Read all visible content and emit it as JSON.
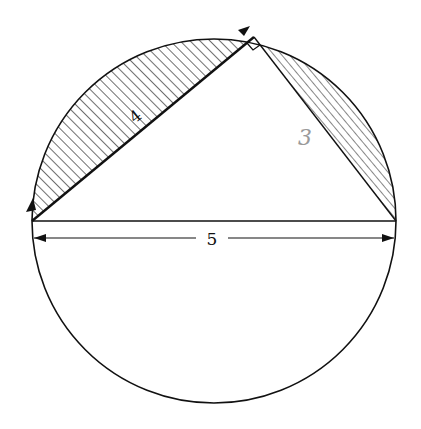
{
  "diagram": {
    "colors": {
      "stroke": "#111111",
      "hatch": "#222222",
      "handwritten": "#9a9a9a",
      "background": "#ffffff"
    },
    "labels": {
      "leg_long": "4",
      "leg_short": "3",
      "diameter": "5"
    },
    "annotations": {
      "right_angle_marker": "right-angle at top vertex",
      "leg_short_note": "label 3 is handwritten in gray pencil"
    }
  }
}
